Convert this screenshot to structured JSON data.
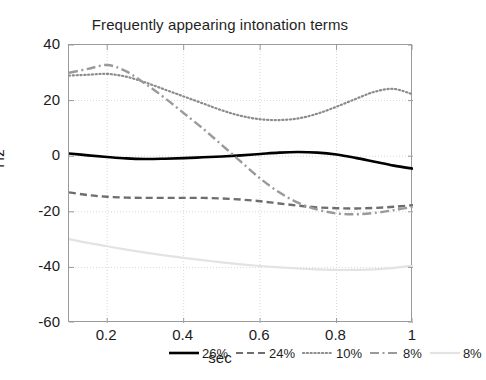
{
  "chart_data": {
    "type": "line",
    "title": "Frequently appearing intonation terms",
    "xlabel": "sec",
    "ylabel": "Hz",
    "xlim": [
      0.1,
      1.0
    ],
    "ylim": [
      -60,
      40
    ],
    "xticks": [
      "0.2",
      "0.4",
      "0.6",
      "0.8",
      "1"
    ],
    "xtick_values": [
      0.2,
      0.4,
      0.6,
      0.8,
      1.0
    ],
    "yticks": [
      "40",
      "20",
      "0",
      "-20",
      "-40",
      "-60"
    ],
    "ytick_values": [
      40,
      20,
      0,
      -20,
      -40,
      -60
    ],
    "grid": true,
    "legend_position": "bottom-inside",
    "x": [
      0.1,
      0.15,
      0.2,
      0.25,
      0.3,
      0.35,
      0.4,
      0.45,
      0.5,
      0.55,
      0.6,
      0.65,
      0.7,
      0.75,
      0.8,
      0.85,
      0.9,
      0.95,
      1.0
    ],
    "series": [
      {
        "name": "26%",
        "label": "26%",
        "style": "solid",
        "color": "#000000",
        "width": 2.6,
        "values": [
          1.0,
          0.3,
          -0.3,
          -0.8,
          -1.0,
          -0.9,
          -0.7,
          -0.4,
          -0.1,
          0.3,
          0.8,
          1.3,
          1.5,
          1.3,
          0.6,
          -0.6,
          -2.0,
          -3.4,
          -4.5
        ]
      },
      {
        "name": "24%",
        "label": "24%",
        "style": "dashed",
        "color": "#6e6e6e",
        "width": 2.4,
        "values": [
          -13.0,
          -14.0,
          -14.6,
          -14.9,
          -15.0,
          -15.0,
          -15.0,
          -15.0,
          -15.2,
          -15.6,
          -16.2,
          -17.0,
          -17.8,
          -18.4,
          -18.7,
          -18.8,
          -18.6,
          -18.2,
          -17.6
        ]
      },
      {
        "name": "10%",
        "label": "10%",
        "style": "dotted",
        "color": "#8c8c8c",
        "width": 2.2,
        "values": [
          29.0,
          29.3,
          29.6,
          28.6,
          26.5,
          24.0,
          21.5,
          19.0,
          16.5,
          14.5,
          13.3,
          13.0,
          13.6,
          15.3,
          17.8,
          20.6,
          23.2,
          24.2,
          22.2
        ]
      },
      {
        "name": "8%",
        "label": "8%",
        "style": "dashdot",
        "color": "#9a9a9a",
        "width": 2.4,
        "values": [
          30.0,
          31.4,
          32.8,
          30.5,
          26.0,
          21.0,
          15.5,
          10.0,
          4.0,
          -2.0,
          -8.0,
          -13.0,
          -16.8,
          -19.2,
          -20.6,
          -20.9,
          -20.4,
          -19.4,
          -18.2
        ]
      },
      {
        "name": "8%",
        "label": "8%",
        "style": "solid-faint",
        "color": "#e3e3e3",
        "width": 2.2,
        "values": [
          -29.8,
          -31.2,
          -32.4,
          -33.6,
          -34.7,
          -35.7,
          -36.6,
          -37.4,
          -38.2,
          -38.9,
          -39.5,
          -40.0,
          -40.4,
          -40.7,
          -40.9,
          -40.9,
          -40.7,
          -40.2,
          -39.4
        ]
      }
    ]
  },
  "legend": {
    "items": [
      {
        "label": "26%",
        "style": "solid",
        "color": "#000000"
      },
      {
        "label": "24%",
        "style": "dashed",
        "color": "#6e6e6e"
      },
      {
        "label": "10%",
        "style": "dotted",
        "color": "#8c8c8c"
      },
      {
        "label": "8%",
        "style": "dashdot",
        "color": "#9a9a9a"
      },
      {
        "label": "8%",
        "style": "solid-faint",
        "color": "#e3e3e3"
      }
    ]
  }
}
